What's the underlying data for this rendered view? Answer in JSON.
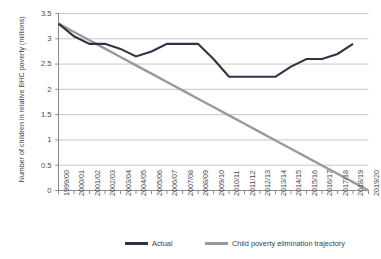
{
  "chart_data": {
    "type": "line",
    "title": "",
    "xlabel": "",
    "ylabel": "Number of children in relative BHC poverty (millions)",
    "ylim": [
      0,
      3.5
    ],
    "ytick_values": [
      0,
      0.5,
      1,
      1.5,
      2,
      2.5,
      3,
      3.5
    ],
    "ytick_labels": [
      "0",
      "0.5",
      "1",
      "1.5",
      "2",
      "2.5",
      "3",
      "3.5"
    ],
    "grid": true,
    "legend_position": "bottom",
    "categories": [
      "1999/00",
      "2000/01",
      "2001/02",
      "2002/03",
      "2003/04",
      "2004/05",
      "2005/06",
      "2006/07",
      "2007/08",
      "2008/09",
      "2009/10",
      "2010/11",
      "2011/12",
      "2012/13",
      "2013/14",
      "2014/15",
      "2015/16",
      "2016/17",
      "2017/18",
      "2018/19",
      "2019/20"
    ],
    "series": [
      {
        "name": "Actual",
        "color": "#2f3444",
        "values": [
          3.3,
          3.05,
          2.9,
          2.9,
          2.8,
          2.65,
          2.75,
          2.9,
          2.9,
          2.9,
          2.6,
          2.25,
          2.25,
          2.25,
          2.25,
          2.45,
          2.6,
          2.6,
          2.7,
          2.9,
          null
        ]
      },
      {
        "name": "Child poverty elimination trajectory",
        "color": "#9a9a9a",
        "values": [
          3.3,
          3.135,
          2.97,
          2.805,
          2.64,
          2.475,
          2.31,
          2.145,
          1.98,
          1.815,
          1.65,
          1.485,
          1.32,
          1.155,
          0.99,
          0.825,
          0.66,
          0.495,
          0.33,
          0.165,
          0
        ]
      }
    ]
  },
  "legend": {
    "entries": [
      {
        "label": "Actual",
        "color": "#2f3444"
      },
      {
        "label": "Child poverty elimination trajectory",
        "color": "#9a9a9a"
      }
    ]
  },
  "axis": {
    "y_title": "Number of children in relative BHC poverty (millions)"
  }
}
